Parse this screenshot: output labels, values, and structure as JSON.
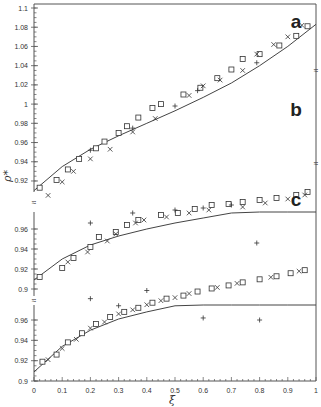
{
  "chart_data": {
    "type": "scatter",
    "title": "",
    "xlabel": "ξ",
    "ylabel": "ρ*",
    "xlim": [
      0,
      1
    ],
    "x_ticks": [
      "0",
      "0.1",
      "0.2",
      "0.3",
      "0.4",
      "0.5",
      "0.6",
      "0.7",
      "0.8",
      "0.9",
      "1"
    ],
    "grid": false,
    "legend": "none",
    "marker_types": [
      "square (□)",
      "cross (×)",
      "plus (+)"
    ],
    "panels": [
      {
        "label": "a",
        "ylim": [
          0.91,
          1.1
        ],
        "y_ticks": [
          "1.1",
          "1.08",
          "1.06",
          "1.04",
          "1.02",
          "1",
          "0.98",
          "0.96",
          "0.94",
          "0.92"
        ],
        "fit_curve": {
          "x": [
            0,
            0.1,
            0.2,
            0.3,
            0.4,
            0.5,
            0.6,
            0.7,
            0.8,
            0.9,
            1.0
          ],
          "y": [
            0.91,
            0.935,
            0.953,
            0.967,
            0.98,
            0.993,
            1.007,
            1.022,
            1.04,
            1.06,
            1.083
          ]
        },
        "series": [
          {
            "name": "squares",
            "marker": "square",
            "x": [
              0.02,
              0.08,
              0.12,
              0.16,
              0.22,
              0.25,
              0.3,
              0.33,
              0.37,
              0.42,
              0.45,
              0.53,
              0.59,
              0.65,
              0.7,
              0.74,
              0.8,
              0.87,
              0.93,
              0.97
            ],
            "y": [
              0.913,
              0.921,
              0.932,
              0.943,
              0.954,
              0.961,
              0.97,
              0.977,
              0.986,
              0.996,
              1.0,
              1.01,
              1.017,
              1.027,
              1.036,
              1.047,
              1.052,
              1.061,
              1.071,
              1.081
            ]
          },
          {
            "name": "crosses",
            "marker": "x",
            "x": [
              0.05,
              0.1,
              0.14,
              0.2,
              0.27,
              0.35,
              0.43,
              0.55,
              0.6,
              0.66,
              0.74,
              0.79,
              0.85,
              0.9,
              0.95
            ],
            "y": [
              0.905,
              0.919,
              0.93,
              0.943,
              0.953,
              0.971,
              0.985,
              1.009,
              1.019,
              1.025,
              1.035,
              1.052,
              1.062,
              1.07,
              1.082
            ]
          },
          {
            "name": "plus",
            "marker": "plus",
            "x": [
              0.2,
              0.35,
              0.5,
              0.58,
              0.79
            ],
            "y": [
              0.952,
              0.975,
              0.998,
              1.014,
              1.043
            ]
          }
        ]
      },
      {
        "label": "b",
        "ylim": [
          0.9,
          0.98
        ],
        "y_ticks": [
          "0.96",
          "0.94",
          "0.92",
          "0.9"
        ],
        "fit_curve": {
          "x": [
            0,
            0.1,
            0.2,
            0.3,
            0.4,
            0.5,
            0.6,
            0.7,
            0.8,
            0.9,
            1.0
          ],
          "y": [
            0.909,
            0.93,
            0.944,
            0.953,
            0.96,
            0.966,
            0.971,
            0.976,
            0.981,
            0.986,
            0.992
          ]
        },
        "series": [
          {
            "name": "squares",
            "marker": "square",
            "x": [
              0.02,
              0.1,
              0.14,
              0.2,
              0.23,
              0.29,
              0.33,
              0.37,
              0.45,
              0.51,
              0.57,
              0.63,
              0.69,
              0.74,
              0.8,
              0.86,
              0.93,
              0.97
            ],
            "y": [
              0.912,
              0.921,
              0.931,
              0.942,
              0.952,
              0.957,
              0.964,
              0.969,
              0.974,
              0.976,
              0.98,
              0.984,
              0.985,
              0.987,
              0.989,
              0.991,
              0.994,
              0.997
            ]
          },
          {
            "name": "crosses",
            "marker": "x",
            "x": [
              0.12,
              0.19,
              0.26,
              0.29,
              0.36,
              0.39,
              0.47,
              0.55,
              0.62,
              0.74,
              0.82,
              0.9,
              0.96
            ],
            "y": [
              0.927,
              0.937,
              0.948,
              0.955,
              0.966,
              0.969,
              0.972,
              0.976,
              0.979,
              0.982,
              0.986,
              0.99,
              0.994
            ]
          },
          {
            "name": "plus",
            "marker": "plus",
            "x": [
              0.2,
              0.35,
              0.5,
              0.6,
              0.7,
              0.79
            ],
            "y": [
              0.966,
              0.976,
              0.979,
              0.981,
              0.984,
              0.946
            ]
          }
        ]
      },
      {
        "label": "c",
        "ylim": [
          0.9,
          0.975
        ],
        "y_ticks": [
          "0.96",
          "0.94",
          "0.92",
          "0.9"
        ],
        "fit_curve": {
          "x": [
            0,
            0.1,
            0.2,
            0.3,
            0.4,
            0.5,
            0.6,
            0.7,
            0.8,
            0.9,
            1.0
          ],
          "y": [
            0.909,
            0.934,
            0.95,
            0.961,
            0.968,
            0.974,
            0.98,
            0.986,
            0.992,
            0.998,
            1.005
          ]
        },
        "series": [
          {
            "name": "squares",
            "marker": "square",
            "x": [
              0.03,
              0.08,
              0.12,
              0.17,
              0.22,
              0.27,
              0.32,
              0.37,
              0.42,
              0.47,
              0.53,
              0.58,
              0.63,
              0.69,
              0.74,
              0.8,
              0.86,
              0.91,
              0.96
            ],
            "y": [
              0.919,
              0.926,
              0.938,
              0.947,
              0.956,
              0.963,
              0.968,
              0.972,
              0.977,
              0.981,
              0.984,
              0.988,
              0.991,
              0.994,
              0.997,
              1.0,
              1.003,
              1.006,
              1.009
            ]
          },
          {
            "name": "crosses",
            "marker": "x",
            "x": [
              0.05,
              0.1,
              0.15,
              0.2,
              0.25,
              0.3,
              0.35,
              0.4,
              0.45,
              0.5,
              0.55,
              0.65,
              0.72,
              0.84,
              0.94
            ],
            "y": [
              0.921,
              0.932,
              0.941,
              0.952,
              0.958,
              0.966,
              0.97,
              0.975,
              0.979,
              0.982,
              0.986,
              0.992,
              0.996,
              1.002,
              1.008
            ]
          },
          {
            "name": "plus",
            "marker": "plus",
            "x": [
              0.2,
              0.3,
              0.4,
              0.6,
              0.8
            ],
            "y": [
              0.981,
              0.974,
              0.989,
              0.962,
              0.96
            ]
          }
        ]
      }
    ]
  },
  "axes": {
    "y_axis_title": "ρ*",
    "x_axis_title": "ξ",
    "break_symbol": "≈"
  }
}
